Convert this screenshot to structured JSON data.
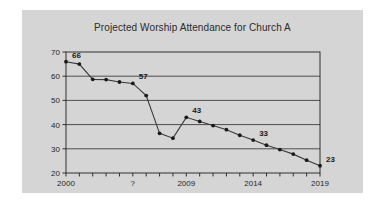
{
  "figure": {
    "background_color": "#ffffff",
    "panel_color": "#d5d5d5"
  },
  "chart_data": {
    "type": "line",
    "title": "Projected Worship Attendance for Church A",
    "xlabel": "",
    "ylabel": "",
    "xlim": [
      2000,
      2019
    ],
    "ylim": [
      20,
      70
    ],
    "grid": true,
    "legend": false,
    "line_color": "#3a3a3a",
    "marker_color": "#1a1a1a",
    "y_ticks": [
      20,
      30,
      40,
      50,
      60,
      70
    ],
    "y_tick_labels": [
      "20",
      "30",
      "40",
      "50",
      "60",
      "70"
    ],
    "x_tick_values": [
      2000,
      2001,
      2002,
      2003,
      2004,
      2005,
      2006,
      2007,
      2008,
      2009,
      2010,
      2011,
      2012,
      2013,
      2014,
      2015,
      2016,
      2017,
      2018,
      2019
    ],
    "x_tick_labels_shown": [
      {
        "value": 2000,
        "label": "2000"
      },
      {
        "value": 2005,
        "label": "?"
      },
      {
        "value": 2009,
        "label": "2009"
      },
      {
        "value": 2014,
        "label": "2014"
      },
      {
        "value": 2019,
        "label": "2019"
      }
    ],
    "x": [
      2000,
      2001,
      2002,
      2003,
      2004,
      2005,
      2006,
      2007,
      2008,
      2009,
      2010,
      2011,
      2012,
      2013,
      2014,
      2015,
      2016,
      2017,
      2018,
      2019
    ],
    "values": [
      66,
      65,
      58.7,
      58.6,
      57.6,
      57,
      52,
      36.4,
      34.4,
      43,
      41.3,
      39.6,
      37.9,
      35.6,
      33.6,
      31.5,
      29.7,
      27.8,
      25.3,
      23
    ],
    "annotations": [
      {
        "x": 2000,
        "y": 66,
        "label": "66"
      },
      {
        "x": 2005,
        "y": 57,
        "label": "57"
      },
      {
        "x": 2009,
        "y": 43,
        "label": "43"
      },
      {
        "x": 2014,
        "y": 33.6,
        "label": "33"
      },
      {
        "x": 2019,
        "y": 23,
        "label": "23"
      }
    ]
  }
}
